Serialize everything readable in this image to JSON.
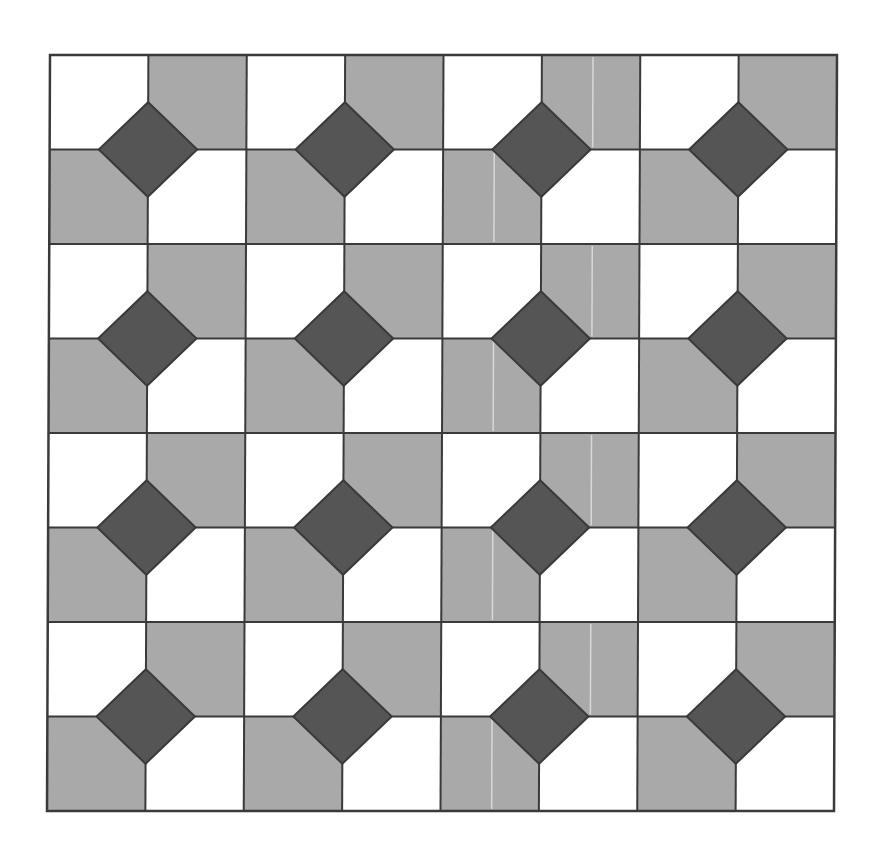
{
  "figure": {
    "grid": {
      "columns": 8,
      "rows": 8,
      "block_columns": 4,
      "block_rows": 4,
      "frame": {
        "top_left": [
          50,
          55
        ],
        "top_right": [
          837,
          55
        ],
        "bottom_left": [
          47,
          811
        ],
        "bottom_right": [
          834,
          811
        ]
      }
    },
    "block_pattern": [
      [
        "light",
        "mid"
      ],
      [
        "mid",
        "light"
      ]
    ],
    "diamond": {
      "position": "centered on each 2x2 block center",
      "half_diagonal_fraction_of_cell": 0.5
    },
    "artifact_line": {
      "block_column_index": 2,
      "x_fraction_in_cell": 0.52,
      "color": "#d8d8d8"
    },
    "colors": {
      "light": "#ffffff",
      "mid": "#a9a9a9",
      "dark": "#555555",
      "stroke": "#3a3a3a",
      "background": "#ffffff"
    },
    "stroke_width": 2
  }
}
